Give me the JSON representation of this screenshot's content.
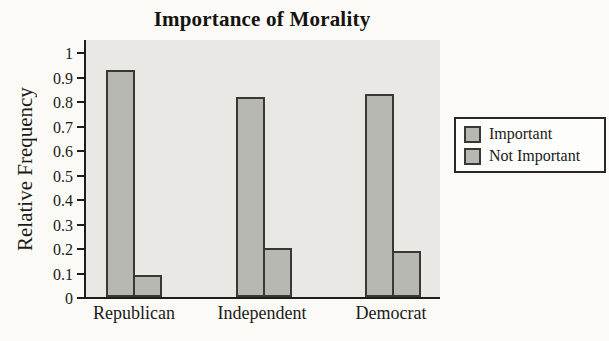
{
  "chart_data": {
    "type": "bar",
    "title": "Importance of Morality",
    "xlabel": "",
    "ylabel": "Relative Frequency",
    "categories": [
      "Republican",
      "Independent",
      "Democrat"
    ],
    "series": [
      {
        "name": "Important",
        "values": [
          0.92,
          0.81,
          0.82
        ]
      },
      {
        "name": "Not Important",
        "values": [
          0.08,
          0.19,
          0.18
        ]
      }
    ],
    "ylim": [
      0,
      1
    ],
    "yticks": [
      0,
      0.1,
      0.2,
      0.3,
      0.4,
      0.5,
      0.6,
      0.7,
      0.8,
      0.9,
      1
    ],
    "ytick_labels": [
      "0",
      "0.1",
      "0.2",
      "0.3",
      "0.4",
      "0.5",
      "0.6",
      "0.7",
      "0.8",
      "0.9",
      "1"
    ],
    "grid": false,
    "legend_position": "right",
    "colors": {
      "page_bg": "#fbfaf7",
      "plot_bg": "#e9e8e4",
      "bar_fill": "#b6b8b1",
      "bar_border": "#3a3833",
      "axis": "#1f1d1a",
      "legend_bg": "#fdfdfb"
    }
  }
}
